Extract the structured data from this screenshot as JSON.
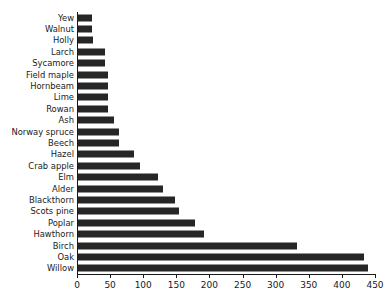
{
  "chart_data": {
    "type": "bar",
    "orientation": "horizontal",
    "title": "",
    "subtitle": "",
    "xlabel": "",
    "ylabel": "",
    "xlim": [
      0,
      450
    ],
    "xticks": [
      0,
      50,
      100,
      150,
      200,
      250,
      300,
      350,
      400,
      450
    ],
    "xtick_labels": [
      "0",
      "50",
      "100",
      "150",
      "200",
      "250",
      "300",
      "350",
      "400",
      "450"
    ],
    "grid": false,
    "legend": false,
    "bar_color": "#262626",
    "axis_color": "#1a1a1a",
    "background_color": "#ffffff",
    "categories": [
      "Yew",
      "Walnut",
      "Holly",
      "Larch",
      "Sycamore",
      "Field maple",
      "Hornbeam",
      "Lime",
      "Rowan",
      "Ash",
      "Norway spruce",
      "Beech",
      "Hazel",
      "Crab apple",
      "Elm",
      "Alder",
      "Blackthorn",
      "Scots pine",
      "Poplar",
      "Hawthorn",
      "Birch",
      "Oak",
      "Willow"
    ],
    "values": [
      21,
      21,
      23,
      41,
      41,
      45,
      45,
      45,
      45,
      54,
      62,
      62,
      85,
      94,
      121,
      128,
      146,
      152,
      176,
      191,
      330,
      432,
      438
    ]
  }
}
